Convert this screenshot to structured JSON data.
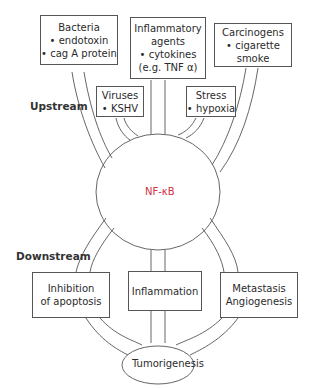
{
  "diagram": {
    "colors": {
      "line": "#555555",
      "center_text": "#d0303f",
      "text": "#2b2b2b"
    },
    "section_labels": {
      "upstream": "Upstream",
      "downstream": "Downstream"
    },
    "center_node": {
      "label": "NF-κB"
    },
    "upstream_boxes": [
      {
        "id": "bacteria",
        "lines": [
          "Bacteria",
          "• endotoxin",
          "• cag A protein"
        ]
      },
      {
        "id": "inflammatory",
        "lines": [
          "Inflammatory",
          "agents",
          "• cytokines",
          "(e.g. TNF α)"
        ]
      },
      {
        "id": "carcinogens",
        "lines": [
          "Carcinogens",
          "• cigarette",
          "smoke"
        ]
      },
      {
        "id": "viruses",
        "lines": [
          "Viruses",
          "• KSHV"
        ]
      },
      {
        "id": "stress",
        "lines": [
          "Stress",
          "• hypoxia"
        ]
      }
    ],
    "downstream_boxes": [
      {
        "id": "apoptosis",
        "lines": [
          "Inhibition",
          "of apoptosis"
        ]
      },
      {
        "id": "inflammation",
        "lines": [
          "Inflammation"
        ]
      },
      {
        "id": "metastasis",
        "lines": [
          "Metastasis",
          "Angiogenesis"
        ]
      }
    ],
    "outcome_node": {
      "label": "Tumorigenesis"
    }
  }
}
